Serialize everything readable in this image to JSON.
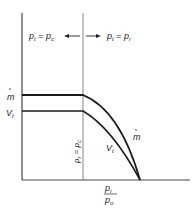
{
  "diagram": {
    "regions": {
      "left": {
        "lhs": "p",
        "lhs_sub": "t",
        "eq": " = ",
        "rhs": "p",
        "rhs_sub": "c"
      },
      "right": {
        "lhs": "p",
        "lhs_sub": "t",
        "eq": " = ",
        "rhs": "p",
        "rhs_sub": "r"
      }
    },
    "y_labels": {
      "mdot": "m",
      "vt": "V",
      "vt_sub": "t"
    },
    "divider_label": {
      "lhs": "p",
      "lhs_sub": "r",
      "eq": " = ",
      "rhs": "p",
      "rhs_sub": "c"
    },
    "curve_labels": {
      "mdot": "m",
      "vt": "V",
      "vt_sub": "t"
    },
    "x_label": {
      "num": "p",
      "num_sub": "r",
      "den": "p",
      "den_sub": "o"
    },
    "colors": {
      "line": "#1a1a1a",
      "axis": "#444444",
      "divider": "#777777"
    }
  }
}
